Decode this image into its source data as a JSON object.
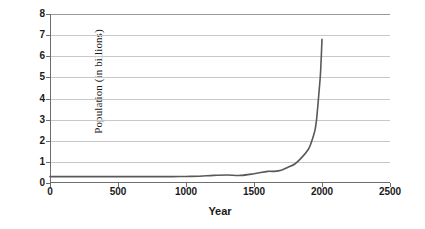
{
  "chart_data": {
    "type": "line",
    "title": "",
    "xlabel": "Year",
    "ylabel": "Population (in billions)",
    "xlim": [
      0,
      2500
    ],
    "ylim": [
      0,
      8
    ],
    "grid": true,
    "legend": false,
    "line_color": "#595959",
    "gridline_color": "#c8c8c8",
    "axis_color": "#6e6e6e",
    "xticks": [
      0,
      500,
      1000,
      1500,
      2000,
      2500
    ],
    "xtick_labels": [
      "0",
      "500",
      "1000",
      "1500",
      "2000",
      "2500"
    ],
    "yticks": [
      0,
      1,
      2,
      3,
      4,
      5,
      6,
      7,
      8
    ],
    "ytick_labels": [
      "0",
      "1",
      "2",
      "3",
      "4",
      "5",
      "6",
      "7",
      "8"
    ],
    "series": [
      {
        "name": "World population",
        "x": [
          0,
          100,
          200,
          300,
          400,
          500,
          600,
          700,
          800,
          900,
          1000,
          1100,
          1200,
          1300,
          1400,
          1500,
          1600,
          1650,
          1700,
          1750,
          1800,
          1850,
          1900,
          1920,
          1940,
          1950,
          1960,
          1970,
          1980,
          1990,
          2000
        ],
        "y": [
          0.3,
          0.3,
          0.3,
          0.3,
          0.3,
          0.3,
          0.3,
          0.3,
          0.3,
          0.3,
          0.31,
          0.32,
          0.36,
          0.38,
          0.36,
          0.44,
          0.55,
          0.55,
          0.6,
          0.75,
          0.9,
          1.2,
          1.6,
          1.9,
          2.3,
          2.55,
          3.0,
          3.7,
          4.45,
          5.3,
          6.8
        ]
      }
    ]
  }
}
